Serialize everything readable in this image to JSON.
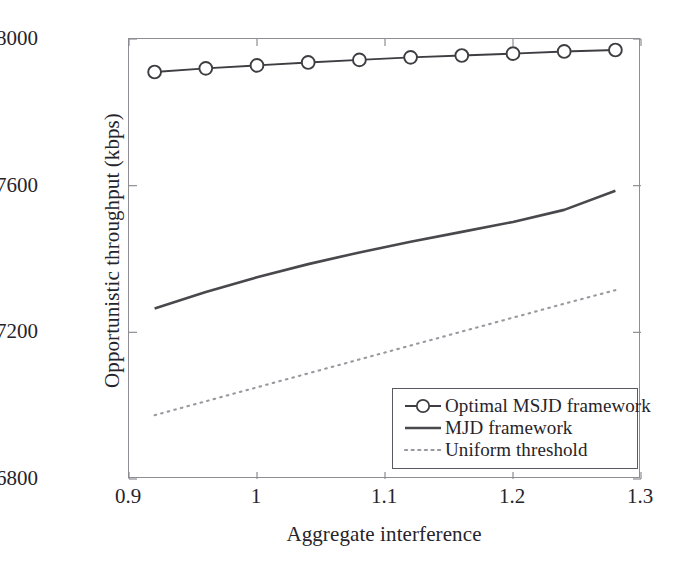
{
  "chart_data": {
    "type": "line",
    "title": "",
    "xlabel": "Aggregate interference",
    "ylabel": "Opportunistic throughput (kbps)",
    "xlim": [
      0.9,
      1.3
    ],
    "ylim": [
      6800,
      8000
    ],
    "xticks": [
      "0.9",
      "1",
      "1.1",
      "1.2",
      "1.3"
    ],
    "xtick_values": [
      0.9,
      1.0,
      1.1,
      1.2,
      1.3
    ],
    "yticks": [
      "6800",
      "7200",
      "7600",
      "8000"
    ],
    "ytick_values": [
      6800,
      7200,
      7600,
      8000
    ],
    "grid": false,
    "legend_position": "lower right",
    "x": [
      0.92,
      0.96,
      1.0,
      1.04,
      1.08,
      1.12,
      1.16,
      1.2,
      1.24,
      1.28
    ],
    "series": [
      {
        "name": "Optimal MSJD framework",
        "style": "solid-with-circle-markers",
        "marker": "circle",
        "color": "#3f3d42",
        "values": [
          7910,
          7920,
          7928,
          7936,
          7943,
          7950,
          7955,
          7960,
          7966,
          7970
        ]
      },
      {
        "name": "MJD framework",
        "style": "solid",
        "marker": "none",
        "color": "#4a484d",
        "values": [
          7265,
          7310,
          7350,
          7386,
          7418,
          7447,
          7474,
          7501,
          7534,
          7586
        ]
      },
      {
        "name": "Uniform threshold",
        "style": "dotted",
        "marker": "none",
        "color": "#9a989e",
        "values": [
          6974,
          7012,
          7050,
          7088,
          7126,
          7164,
          7202,
          7240,
          7278,
          7315
        ]
      }
    ]
  },
  "legend": {
    "items": [
      {
        "label": "Optimal MSJD framework",
        "key": "circle-marker-line-icon"
      },
      {
        "label": "MJD framework",
        "key": "solid-line-icon"
      },
      {
        "label": "Uniform threshold",
        "key": "dotted-line-icon"
      }
    ]
  },
  "axes": {
    "x_title": "Aggregate interference",
    "y_title": "Opportunistic throughput (kbps)"
  }
}
